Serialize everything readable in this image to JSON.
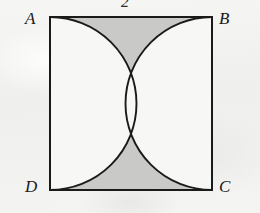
{
  "figure": {
    "background_color": "#f2f2f0",
    "stroke_color": "#1a1a1a",
    "shaded_fill_color": "#c9c9c7",
    "unshaded_fill_color": "#f7f7f5",
    "square": {
      "name": "ABCD",
      "left": 50,
      "top": 17,
      "right": 212,
      "bottom": 190,
      "width": 162,
      "height": 173,
      "stroke_width": 2
    },
    "vertices": [
      {
        "id": "A",
        "label": "A",
        "position": "top-left"
      },
      {
        "id": "B",
        "label": "B",
        "position": "top-right"
      },
      {
        "id": "C",
        "label": "C",
        "position": "bottom-right"
      },
      {
        "id": "D",
        "label": "D",
        "position": "bottom-left"
      }
    ],
    "side_labels": [
      {
        "id": "top",
        "label": "2",
        "side": "AB",
        "note": "side length label above top edge, cropped at image top"
      }
    ],
    "arcs": [
      {
        "id": "left-semicircle",
        "diameter_side": "AD",
        "bulge_direction": "right",
        "from": "A",
        "to": "D",
        "radius": 86.5
      },
      {
        "id": "right-semicircle",
        "diameter_side": "BC",
        "bulge_direction": "left",
        "from": "B",
        "to": "C",
        "radius": 86.5
      }
    ],
    "regions": [
      {
        "id": "top-curvilinear-triangle",
        "shaded": true,
        "fill": "#c9c9c7"
      },
      {
        "id": "bottom-curvilinear-triangle",
        "shaded": true,
        "fill": "#c9c9c7"
      },
      {
        "id": "left-semicircle-interior",
        "shaded": false,
        "fill": "#f7f7f5"
      },
      {
        "id": "right-semicircle-interior",
        "shaded": false,
        "fill": "#f7f7f5"
      }
    ],
    "tangent_point": {
      "id": "center",
      "x": 131,
      "y": 103.5,
      "note": "semicircles meet at square center"
    }
  }
}
